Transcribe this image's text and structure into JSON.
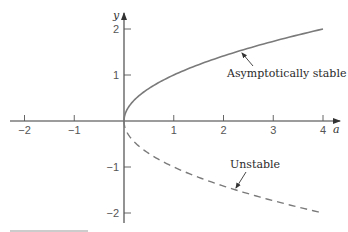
{
  "chart_data": {
    "type": "line",
    "title": "",
    "xlabel": "a",
    "ylabel": "y",
    "xlim": [
      -2.3,
      4.3
    ],
    "ylim": [
      -2.2,
      2.3
    ],
    "grid": false,
    "legend": "none",
    "x_ticks": [
      -2,
      -1,
      1,
      2,
      3,
      4
    ],
    "x_tick_labels": [
      "−2",
      "−1",
      "1",
      "2",
      "3",
      "4"
    ],
    "y_ticks": [
      2,
      1,
      -1,
      -2
    ],
    "y_tick_labels": [
      "2",
      "1",
      "−1",
      "−2"
    ],
    "series": [
      {
        "name": "Asymptotically stable",
        "style": "solid",
        "formula": "y = sqrt(a)",
        "x": [
          0,
          0.05,
          0.1,
          0.25,
          0.5,
          0.75,
          1,
          1.5,
          2,
          2.5,
          3,
          3.5,
          4
        ],
        "y": [
          0,
          0.224,
          0.316,
          0.5,
          0.707,
          0.866,
          1,
          1.225,
          1.414,
          1.581,
          1.732,
          1.871,
          2
        ]
      },
      {
        "name": "Unstable",
        "style": "dashed",
        "formula": "y = -sqrt(a)",
        "x": [
          0,
          0.05,
          0.1,
          0.25,
          0.5,
          0.75,
          1,
          1.5,
          2,
          2.5,
          3,
          3.5,
          4
        ],
        "y": [
          0,
          -0.224,
          -0.316,
          -0.5,
          -0.707,
          -0.866,
          -1,
          -1.225,
          -1.414,
          -1.581,
          -1.732,
          -1.871,
          -2
        ]
      }
    ],
    "annotations": [
      {
        "text": "Asymptotically stable",
        "arrow_to": [
          2.35,
          1.53
        ]
      },
      {
        "text": "Unstable",
        "arrow_to": [
          2.25,
          -1.5
        ]
      }
    ]
  },
  "labels": {
    "x_axis": "a",
    "y_axis": "y",
    "stable": "Asymptotically stable",
    "unstable": "Unstable"
  },
  "colors": {
    "curve": "#7a7a7a",
    "axis": "#3a3a3a",
    "text": "#2a2a2a"
  }
}
